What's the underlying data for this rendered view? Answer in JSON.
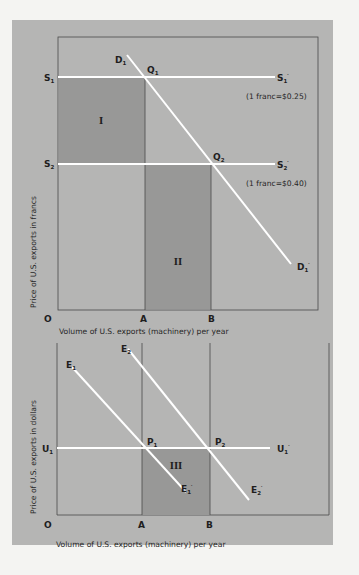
{
  "colors": {
    "page_bg": "#f4f4f2",
    "panel_bg": "#b5b5b4",
    "shaded_region": "#989897",
    "axis_line": "#4a4a4a",
    "curve": "#ffffff",
    "text": "#1e1e1e"
  },
  "top_chart": {
    "y_axis_title": "Price of U.S. exports in francs",
    "x_axis_title": "Volume of U.S. exports (machinery) per year",
    "origin_label": "O",
    "x_marks": [
      {
        "label": "A"
      },
      {
        "label": "B"
      }
    ],
    "supply_lines": [
      {
        "left_label": "S",
        "left_sub": "1",
        "right_label": "S",
        "right_sub": "1",
        "right_prime": "′",
        "note": "(1 franc=$0.25)"
      },
      {
        "left_label": "S",
        "left_sub": "2",
        "right_label": "S",
        "right_sub": "2",
        "right_prime": "′",
        "note": "(1 franc=$0.40)"
      }
    ],
    "demand_curve": {
      "start_label": "D",
      "start_sub": "1",
      "end_label": "D",
      "end_sub": "1",
      "end_prime": "′"
    },
    "points": [
      {
        "label": "Q",
        "sub": "1"
      },
      {
        "label": "Q",
        "sub": "2"
      }
    ],
    "regions": [
      {
        "label": "I"
      },
      {
        "label": "II"
      }
    ]
  },
  "bottom_chart": {
    "y_axis_title": "Price of U.S. exports in dollars",
    "x_axis_title": "Volume of U.S. exports (machinery) per year",
    "origin_label": "O",
    "x_marks": [
      {
        "label": "A"
      },
      {
        "label": "B"
      }
    ],
    "price_line": {
      "left_label": "U",
      "left_sub": "1",
      "right_label": "U",
      "right_sub": "1",
      "right_prime": "′"
    },
    "curves": [
      {
        "start_label": "E",
        "start_sub": "1",
        "end_label": "E",
        "end_sub": "1",
        "end_prime": "′"
      },
      {
        "start_label": "E",
        "start_sub": "2",
        "end_label": "E",
        "end_sub": "2",
        "end_prime": "′"
      }
    ],
    "points": [
      {
        "label": "P",
        "sub": "1"
      },
      {
        "label": "P",
        "sub": "2"
      }
    ],
    "regions": [
      {
        "label": "III"
      }
    ]
  }
}
